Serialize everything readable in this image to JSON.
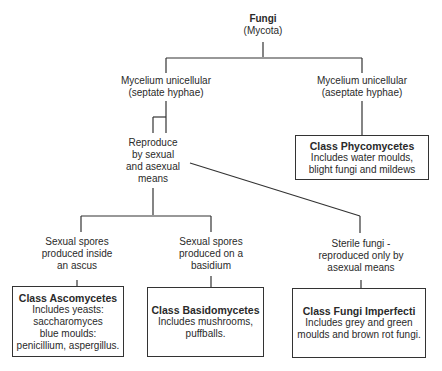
{
  "root": {
    "title": "Fungi",
    "subtitle": "(Mycota)"
  },
  "level1": [
    {
      "line1": "Mycelium unicellular",
      "line2": "(septate hyphae)"
    },
    {
      "line1": "Mycelium unicellular",
      "line2": "(aseptate hyphae)"
    }
  ],
  "reproduce": {
    "lines": [
      "Reproduce",
      "by sexual",
      "and asexual",
      "means"
    ]
  },
  "phycomycetes": {
    "title": "Class Phycomycetes",
    "lines": [
      "Includes water moulds,",
      "blight fungi and mildews"
    ]
  },
  "level3": [
    {
      "lines": [
        "Sexual spores",
        "produced inside",
        "an ascus"
      ]
    },
    {
      "lines": [
        "Sexual spores",
        "produced on a",
        "basidium"
      ]
    },
    {
      "lines": [
        "Sterile fungi -",
        "reproduced only by",
        "asexual means"
      ]
    }
  ],
  "classes": [
    {
      "title": "Class Ascomycetes",
      "lines": [
        "Includes yeasts:",
        "saccharomyces",
        "blue moulds:",
        "penicillium, aspergillus."
      ]
    },
    {
      "title": "Class Basidomycetes",
      "lines": [
        "Includes mushrooms,",
        "puffballs."
      ]
    },
    {
      "title": "Class Fungi Imperfecti",
      "lines": [
        "Includes grey and green",
        "moulds and brown rot fungi."
      ]
    }
  ]
}
